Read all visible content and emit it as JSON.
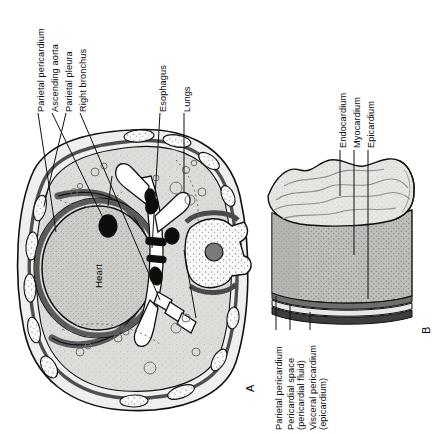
{
  "figure": {
    "orientation": "text rotated 90 degrees counter-clockwise",
    "background": "#ffffff",
    "ink": "#111111"
  },
  "panels": [
    {
      "id": "A",
      "marker": "A",
      "name": "transverse-section-of-thorax",
      "labels": [
        {
          "key": "parietal_pericardium",
          "text": "Parietal pericardium"
        },
        {
          "key": "ascending_aorta",
          "text": "Ascending aorta"
        },
        {
          "key": "parietal_pleura",
          "text": "Parietal pleura"
        },
        {
          "key": "right_bronchus",
          "text": "Right bronchus"
        },
        {
          "key": "esophagus",
          "text": "Esophagus"
        },
        {
          "key": "lungs",
          "text": "Lungs"
        },
        {
          "key": "heart",
          "text": "Heart"
        }
      ]
    },
    {
      "id": "B",
      "marker": "B",
      "name": "heart-wall-layers-block",
      "labels_top": [
        {
          "key": "endocardium",
          "text": "Endocardium"
        },
        {
          "key": "myocardium",
          "text": "Myocardium"
        },
        {
          "key": "epicardium",
          "text": "Epicardium"
        }
      ],
      "labels_bottom": [
        {
          "key": "parietal_pericardium_b",
          "line1": "Parietal pericardium",
          "line2": ""
        },
        {
          "key": "pericardial_space",
          "line1": "Pericardial space",
          "line2": "(pericardial fluid)"
        },
        {
          "key": "visceral_pericardium",
          "line1": "Visceral pericardium",
          "line2": "(epicardium)"
        }
      ]
    }
  ],
  "palette": {
    "lung_fill": "#d8d8d6",
    "heart_fill": "#c9c9c6",
    "pleural_dark": "#636363",
    "bone_white": "#fdfdfd",
    "vessel_black": "#0d0d0d",
    "myocardium": "#b9b9b6",
    "endocardium": "#e3e3e0",
    "pericardium_dark": "#4a4a4a",
    "outline": "#111111"
  }
}
